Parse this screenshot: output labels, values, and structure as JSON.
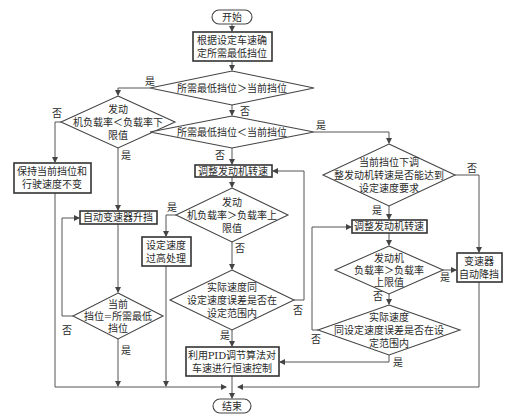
{
  "diagram": {
    "type": "flowchart",
    "nodes": {
      "start": {
        "label": "开始",
        "shape": "terminal"
      },
      "determine_gear": {
        "lines": [
          "根据设定车速确",
          "定所需最低挡位"
        ],
        "shape": "process"
      },
      "d_gear_greater": {
        "lines": [
          "所需最低挡位＞当前挡位"
        ],
        "shape": "decision"
      },
      "d_load_lower": {
        "lines": [
          "发动",
          "机负载率＜负载率下",
          "限值"
        ],
        "shape": "decision"
      },
      "d_gear_less": {
        "lines": [
          "所需最低挡位＜当前挡位"
        ],
        "shape": "decision"
      },
      "keep_gear": {
        "lines": [
          "保持当前挡位和",
          "行驶速度不变"
        ],
        "shape": "process"
      },
      "adjust_rpm_mid": {
        "lines": [
          "调整发动机转速"
        ],
        "shape": "process"
      },
      "d_load_upper_mid": {
        "lines": [
          "发动",
          "机负载率＞负载率上",
          "限值"
        ],
        "shape": "decision"
      },
      "upshift": {
        "lines": [
          "自动变速器升挡"
        ],
        "shape": "process"
      },
      "speed_too_high": {
        "lines": [
          "设定速度",
          "过高处理"
        ],
        "shape": "process"
      },
      "d_gear_equal": {
        "lines": [
          "当前",
          "挡位=所需最低",
          "挡位"
        ],
        "shape": "decision"
      },
      "d_speed_err_mid": {
        "lines": [
          "实际速度同",
          "设定速度误差是否在",
          "设定范围内"
        ],
        "shape": "decision"
      },
      "pid_control": {
        "lines": [
          "利用PID调节算法对",
          "车速进行恒速控制"
        ],
        "shape": "process"
      },
      "end": {
        "label": "结束",
        "shape": "terminal"
      },
      "d_can_reach": {
        "lines": [
          "当前挡位下调",
          "整发动机转速是否能达到",
          "设定速度要求"
        ],
        "shape": "decision"
      },
      "adjust_rpm_right": {
        "lines": [
          "调整发动机转速"
        ],
        "shape": "process"
      },
      "d_load_upper_right": {
        "lines": [
          "发动机",
          "负载率＞负载率",
          "上限值"
        ],
        "shape": "decision"
      },
      "downshift": {
        "lines": [
          "变速器",
          "自动降挡"
        ],
        "shape": "process"
      },
      "d_speed_err_right": {
        "lines": [
          "实际速度",
          "同设定速度误差是否在设",
          "定范围内"
        ],
        "shape": "decision"
      }
    },
    "edge_labels": {
      "yes": "是",
      "no": "否"
    }
  }
}
